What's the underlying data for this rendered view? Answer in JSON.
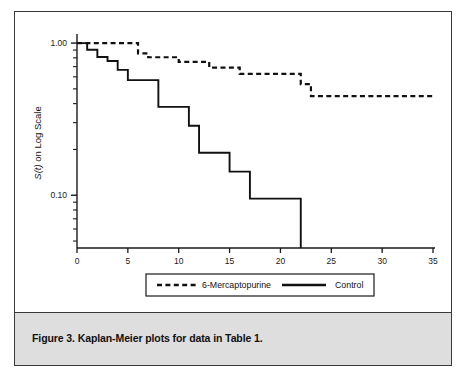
{
  "figure": {
    "caption": "Figure 3. Kaplan-Meier plots for data in Table 1.",
    "frame_border_color": "#3a3a3a",
    "caption_band_color": "#dedede"
  },
  "chart_data": {
    "type": "line",
    "subtype": "kaplan-meier-step",
    "title": "",
    "xlabel": "t (in weeks)",
    "xlabel_italic_part": "t",
    "xlabel_rest": " (in weeks)",
    "ylabel": "S(t) on Log Scale",
    "ylabel_italic_part": "S(t)",
    "ylabel_rest": " on Log Scale",
    "yscale": "log",
    "xlim": [
      0,
      35
    ],
    "ylim": [
      0.045,
      1.08
    ],
    "grid": false,
    "legend_position": "below-axes",
    "xticks": [
      0,
      5,
      10,
      15,
      20,
      25,
      30,
      35
    ],
    "xtick_labels": [
      "0",
      "5",
      "10",
      "15",
      "20",
      "25",
      "30",
      "35"
    ],
    "yticks_major": [
      1.0,
      0.1
    ],
    "ytick_labels": [
      "1.00",
      "0.10"
    ],
    "yticks_minor": [
      0.9,
      0.8,
      0.7,
      0.6,
      0.5,
      0.4,
      0.3,
      0.2,
      0.09,
      0.08,
      0.07,
      0.06,
      0.05
    ],
    "series": [
      {
        "name": "6-Mercaptopurine",
        "style": "dashed",
        "color": "#111111",
        "steps": [
          {
            "t": 0,
            "s": 1.0
          },
          {
            "t": 6,
            "s": 0.857
          },
          {
            "t": 7,
            "s": 0.807
          },
          {
            "t": 10,
            "s": 0.753
          },
          {
            "t": 13,
            "s": 0.69
          },
          {
            "t": 16,
            "s": 0.627
          },
          {
            "t": 22,
            "s": 0.538
          },
          {
            "t": 23,
            "s": 0.448
          },
          {
            "t": 35,
            "s": 0.448
          }
        ]
      },
      {
        "name": "Control",
        "style": "solid",
        "color": "#111111",
        "steps": [
          {
            "t": 0,
            "s": 1.0
          },
          {
            "t": 1,
            "s": 0.905
          },
          {
            "t": 2,
            "s": 0.81
          },
          {
            "t": 3,
            "s": 0.762
          },
          {
            "t": 4,
            "s": 0.667
          },
          {
            "t": 5,
            "s": 0.571
          },
          {
            "t": 8,
            "s": 0.381
          },
          {
            "t": 11,
            "s": 0.286
          },
          {
            "t": 12,
            "s": 0.19
          },
          {
            "t": 15,
            "s": 0.143
          },
          {
            "t": 17,
            "s": 0.095
          },
          {
            "t": 22,
            "s": 0.045
          }
        ]
      }
    ],
    "legend": [
      {
        "label": "6-Mercaptopurine",
        "style": "dashed"
      },
      {
        "label": "Control",
        "style": "solid"
      }
    ]
  }
}
